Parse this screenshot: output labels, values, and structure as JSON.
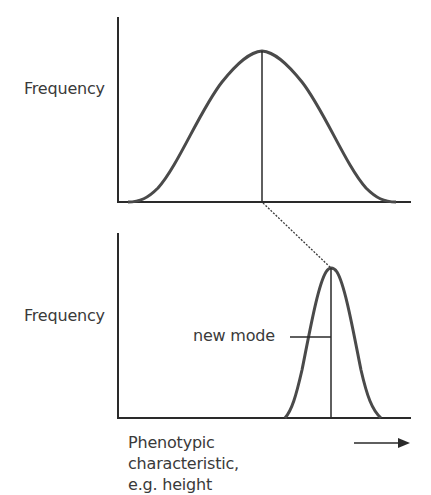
{
  "diagram": {
    "title": "",
    "top_panel": {
      "y_axis_label": "Frequency",
      "curve": "broad normal distribution",
      "mode_line": true
    },
    "bottom_panel": {
      "y_axis_label": "Frequency",
      "curve": "narrow normal distribution shifted right",
      "mode_label": "new mode"
    },
    "x_axis_label_line1": "Phenotypic characteristic,",
    "x_axis_label_line2": "e.g. height",
    "arrow": "right-arrow",
    "connector": "dashed line from original mode to new mode",
    "colors": {
      "line": "#3a3a3a",
      "background": "#ffffff"
    }
  }
}
